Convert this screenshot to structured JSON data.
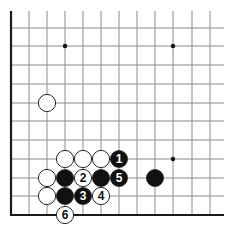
{
  "diagram": {
    "type": "go-board-diagram",
    "colors": {
      "background": "#ffffff",
      "line": "#8a8a8a",
      "border": "#1a1a1a",
      "black": "#111111",
      "white": "#ffffff",
      "star": "#111111"
    },
    "grid": {
      "columns_x": [
        11,
        29,
        47,
        65,
        83,
        101,
        119,
        137,
        155,
        173,
        192,
        210
      ],
      "rows_y": [
        28,
        46,
        65,
        84,
        103,
        121,
        140,
        159,
        178,
        196,
        215
      ],
      "top": 11,
      "right": 224,
      "left_border_x": 11,
      "bottom_border_y": 215
    },
    "star_points": [
      {
        "col": 3,
        "row": 1
      },
      {
        "col": 9,
        "row": 1
      },
      {
        "col": 9,
        "row": 7
      }
    ],
    "stones": [
      {
        "color": "white",
        "col": 2,
        "row": 4,
        "label": ""
      },
      {
        "color": "white",
        "col": 3,
        "row": 7,
        "label": ""
      },
      {
        "color": "white",
        "col": 4,
        "row": 7,
        "label": ""
      },
      {
        "color": "white",
        "col": 5,
        "row": 7,
        "label": ""
      },
      {
        "color": "black",
        "col": 6,
        "row": 7,
        "label": "1"
      },
      {
        "color": "white",
        "col": 2,
        "row": 8,
        "label": ""
      },
      {
        "color": "black",
        "col": 3,
        "row": 8,
        "label": ""
      },
      {
        "color": "white",
        "col": 4,
        "row": 8,
        "label": "2"
      },
      {
        "color": "black",
        "col": 5,
        "row": 8,
        "label": ""
      },
      {
        "color": "black",
        "col": 6,
        "row": 8,
        "label": "5"
      },
      {
        "color": "black",
        "col": 8,
        "row": 8,
        "label": ""
      },
      {
        "color": "white",
        "col": 2,
        "row": 9,
        "label": ""
      },
      {
        "color": "black",
        "col": 3,
        "row": 9,
        "label": ""
      },
      {
        "color": "black",
        "col": 4,
        "row": 9,
        "label": "3"
      },
      {
        "color": "white",
        "col": 5,
        "row": 9,
        "label": "4"
      },
      {
        "color": "white",
        "col": 3,
        "row": 10,
        "label": "6"
      }
    ]
  }
}
